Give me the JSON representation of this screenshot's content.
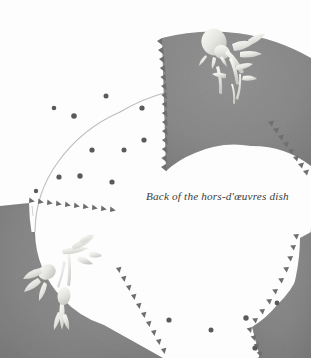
{
  "figure": {
    "caption": "Back of the hors-d'œuvres dish"
  },
  "canvas": {
    "width": 311,
    "height": 358,
    "background_color": "#fdfdfd"
  },
  "palette": {
    "background": "#fdfdfd",
    "segment_gray": "#8a8a8a",
    "segment_gray_dark": "#7d7d7d",
    "segment_gray_light": "#989898",
    "rim_outline": "#b9b9b9",
    "dot_color": "#5a5a5a",
    "relief_white": "#f2f2ee",
    "caption_color": "#3c3c3c",
    "tooth_shadow": "#565656"
  },
  "plate": {
    "shape": "annulus",
    "center_x": 155,
    "center_y": 232,
    "outer_radius": 197,
    "inner_radius": 96,
    "segment_count": 4,
    "segments": [
      {
        "name": "segment-top-right",
        "start_angle_deg": -88,
        "end_angle_deg": -2,
        "fill": "#8a8a8a",
        "has_motif": true,
        "motif": "floral-relief"
      },
      {
        "name": "segment-bottom-left",
        "start_angle_deg": 128,
        "end_angle_deg": 206,
        "fill": "#8a8a8a",
        "has_motif": true,
        "motif": "floral-relief"
      },
      {
        "name": "segment-bottom-right",
        "start_angle_deg": 42,
        "end_angle_deg": 96,
        "fill": "#8a8a8a",
        "has_motif": false,
        "motif": ""
      }
    ],
    "dots": [
      {
        "cx": 106,
        "cy": 96,
        "r": 2.5
      },
      {
        "cx": 74,
        "cy": 116,
        "r": 2.8
      },
      {
        "cx": 142,
        "cy": 108,
        "r": 2.6
      },
      {
        "cx": 144,
        "cy": 140,
        "r": 2.6
      },
      {
        "cx": 124,
        "cy": 150,
        "r": 2.5
      },
      {
        "cx": 92,
        "cy": 150,
        "r": 2.6
      },
      {
        "cx": 80,
        "cy": 176,
        "r": 2.7
      },
      {
        "cx": 59,
        "cy": 177,
        "r": 2.6
      },
      {
        "cx": 112,
        "cy": 182,
        "r": 2.6
      },
      {
        "cx": 54,
        "cy": 108,
        "r": 2.3
      },
      {
        "cx": 36,
        "cy": 191,
        "r": 2.2
      },
      {
        "cx": 169,
        "cy": 320,
        "r": 2.6
      },
      {
        "cx": 211,
        "cy": 330,
        "r": 2.5
      },
      {
        "cx": 246,
        "cy": 318,
        "r": 2.7
      },
      {
        "cx": 255,
        "cy": 348,
        "r": 2.6
      },
      {
        "cx": 277,
        "cy": 303,
        "r": 2.4
      }
    ]
  }
}
